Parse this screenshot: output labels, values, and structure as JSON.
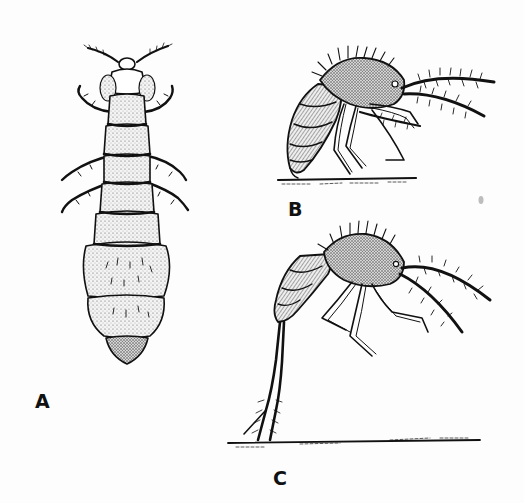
{
  "figure": {
    "ink_color": "#111111",
    "paper_color": "#fdfdfd",
    "panels": [
      {
        "label": "A",
        "view": "dorsal view, elongate segmented body with antennae and six legs"
      },
      {
        "label": "B",
        "view": "lateral view, hairy insect standing on ground with long bristly antennae"
      },
      {
        "label": "C",
        "view": "lateral view, insect supported on extended furcula (springing organ) above ground line"
      }
    ]
  }
}
